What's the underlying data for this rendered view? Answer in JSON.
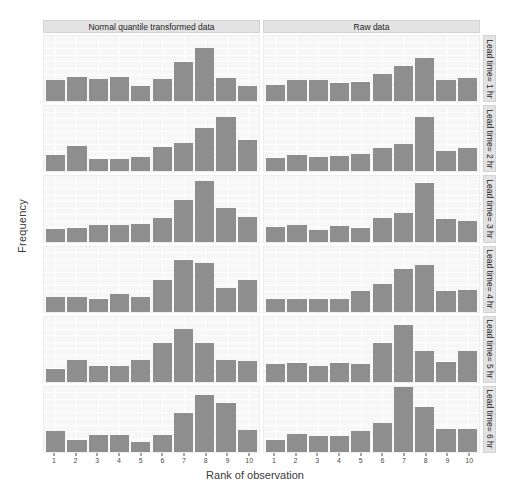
{
  "chart_data": {
    "type": "bar",
    "title": "",
    "xlabel": "Rank of observation",
    "ylabel": "Frequency",
    "ylim": [
      0,
      0.25
    ],
    "yticks": [
      0.0,
      0.05,
      0.1,
      0.15,
      0.2,
      0.25
    ],
    "ytick_labels": [
      "0.00",
      "0.05",
      "0.10",
      "0.15",
      "0.20",
      "0.25"
    ],
    "categories": [
      "1",
      "2",
      "3",
      "4",
      "5",
      "6",
      "7",
      "8",
      "9",
      "10"
    ],
    "grid": true,
    "legend": "none",
    "facet_cols": [
      "Normal quantile transformed data",
      "Raw data"
    ],
    "facet_rows": [
      "Lead time= 1 hr",
      "Lead time= 2 hr",
      "Lead time= 3 hr",
      "Lead time= 4 hr",
      "Lead time= 5 hr",
      "Lead time= 6 hr"
    ],
    "bar_color": "#8e8e8e",
    "panel_background": "#f7f7f7",
    "strip_background": "#e3e3e3",
    "panels": [
      {
        "row": "Lead time= 1 hr",
        "col": "Normal quantile transformed data",
        "values": [
          0.082,
          0.094,
          0.087,
          0.094,
          0.058,
          0.085,
          0.152,
          0.205,
          0.09,
          0.058
        ]
      },
      {
        "row": "Lead time= 1 hr",
        "col": "Raw data",
        "values": [
          0.062,
          0.082,
          0.082,
          0.068,
          0.075,
          0.105,
          0.135,
          0.165,
          0.08,
          0.09
        ]
      },
      {
        "row": "Lead time= 2 hr",
        "col": "Normal quantile transformed data",
        "values": [
          0.063,
          0.097,
          0.048,
          0.048,
          0.055,
          0.095,
          0.11,
          0.167,
          0.207,
          0.12
        ]
      },
      {
        "row": "Lead time= 2 hr",
        "col": "Raw data",
        "values": [
          0.05,
          0.062,
          0.055,
          0.058,
          0.067,
          0.09,
          0.105,
          0.21,
          0.08,
          0.09
        ]
      },
      {
        "row": "Lead time= 3 hr",
        "col": "Normal quantile transformed data",
        "values": [
          0.048,
          0.05,
          0.063,
          0.065,
          0.068,
          0.09,
          0.16,
          0.233,
          0.128,
          0.095
        ]
      },
      {
        "row": "Lead time= 3 hr",
        "col": "Raw data",
        "values": [
          0.055,
          0.065,
          0.045,
          0.058,
          0.052,
          0.09,
          0.108,
          0.225,
          0.085,
          0.08
        ]
      },
      {
        "row": "Lead time= 4 hr",
        "col": "Normal quantile transformed data",
        "values": [
          0.057,
          0.055,
          0.047,
          0.068,
          0.058,
          0.12,
          0.197,
          0.185,
          0.09,
          0.12
        ]
      },
      {
        "row": "Lead time= 4 hr",
        "col": "Raw data",
        "values": [
          0.048,
          0.047,
          0.05,
          0.048,
          0.08,
          0.105,
          0.165,
          0.18,
          0.08,
          0.085
        ]
      },
      {
        "row": "Lead time= 5 hr",
        "col": "Normal quantile transformed data",
        "values": [
          0.05,
          0.083,
          0.062,
          0.06,
          0.083,
          0.148,
          0.202,
          0.15,
          0.085,
          0.08
        ]
      },
      {
        "row": "Lead time= 5 hr",
        "col": "Raw data",
        "values": [
          0.068,
          0.072,
          0.062,
          0.072,
          0.068,
          0.15,
          0.218,
          0.12,
          0.078,
          0.118
        ]
      },
      {
        "row": "Lead time= 6 hr",
        "col": "Normal quantile transformed data",
        "values": [
          0.082,
          0.047,
          0.065,
          0.065,
          0.038,
          0.067,
          0.15,
          0.22,
          0.187,
          0.085
        ]
      },
      {
        "row": "Lead time= 6 hr",
        "col": "Raw data",
        "values": [
          0.048,
          0.07,
          0.062,
          0.063,
          0.08,
          0.11,
          0.248,
          0.172,
          0.09,
          0.088
        ]
      }
    ]
  }
}
